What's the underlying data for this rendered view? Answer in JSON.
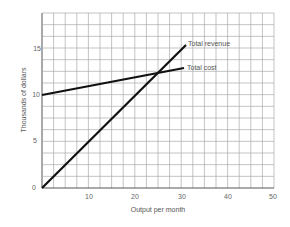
{
  "chart_data": {
    "type": "line",
    "title": "",
    "xlabel": "Output per month",
    "ylabel": "Thousands of dollars",
    "xlim": [
      0,
      50
    ],
    "ylim": [
      0,
      18.75
    ],
    "x_ticks": [
      10,
      20,
      30,
      40,
      50
    ],
    "y_ticks": [
      0,
      5,
      10,
      15
    ],
    "grid": true,
    "grid_x_step": 2.5,
    "grid_y_step": 1.25,
    "series": [
      {
        "name": "Total revenue",
        "x": [
          0,
          30
        ],
        "values": [
          0,
          15.2
        ]
      },
      {
        "name": "Total cost",
        "x": [
          0,
          30
        ],
        "values": [
          10,
          13
        ]
      }
    ],
    "annotations": [
      "Total revenue",
      "Total cost"
    ]
  },
  "labels": {
    "xlabel": "Output per month",
    "ylabel": "Thousands of dollars",
    "revenue": "Total revenue",
    "cost": "Total cost",
    "x10": "10",
    "x20": "20",
    "x30": "30",
    "x40": "40",
    "x50": "50",
    "y0": "0",
    "y5": "5",
    "y10": "10",
    "y15": "15"
  }
}
